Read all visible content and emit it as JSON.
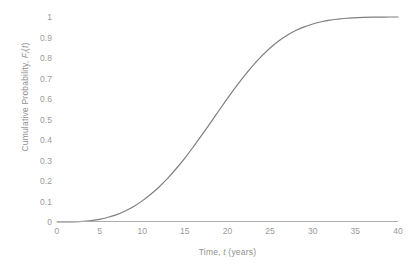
{
  "chart_data": {
    "type": "line",
    "title": "",
    "xlabel": "Time, t (years)",
    "ylabel": "Cumulative Probability, Fi(t)",
    "xlabel_parts": {
      "prefix": "Time, ",
      "symbol": "t",
      "suffix": " (years)"
    },
    "ylabel_parts": {
      "prefix": "Cumulative Probability, ",
      "symbol": "F",
      "subscript": "i",
      "suffix": "(t)"
    },
    "xlim": [
      0,
      40
    ],
    "ylim": [
      0,
      1
    ],
    "xticks": [
      0,
      5,
      10,
      15,
      20,
      25,
      30,
      35,
      40
    ],
    "xtick_labels": [
      "0",
      "5",
      "10",
      "15",
      "20",
      "25",
      "30",
      "35",
      "40"
    ],
    "yticks": [
      0,
      0.1,
      0.2,
      0.3,
      0.4,
      0.5,
      0.6,
      0.7,
      0.8,
      0.9,
      1
    ],
    "ytick_labels": [
      "0",
      "0.1",
      "0.2",
      "0.3",
      "0.4",
      "0.5",
      "0.6",
      "0.7",
      "0.8",
      "0.9",
      "1"
    ],
    "grid": false,
    "legend": null,
    "legend_position": "none",
    "line_color": "#7f7f7f",
    "line_width": 1.2,
    "series": [
      {
        "name": "Cumulative Probability",
        "x": [
          0,
          1,
          2,
          3,
          4,
          5,
          6,
          7,
          8,
          9,
          10,
          11,
          12,
          13,
          14,
          15,
          16,
          17,
          18,
          19,
          20,
          21,
          22,
          23,
          24,
          25,
          26,
          27,
          28,
          29,
          30,
          31,
          32,
          33,
          34,
          35,
          36,
          37,
          38,
          39,
          40
        ],
        "values": [
          0.0,
          0.0,
          0.001,
          0.003,
          0.007,
          0.013,
          0.023,
          0.036,
          0.054,
          0.076,
          0.103,
          0.135,
          0.172,
          0.214,
          0.261,
          0.312,
          0.367,
          0.425,
          0.484,
          0.544,
          0.603,
          0.66,
          0.714,
          0.764,
          0.809,
          0.849,
          0.883,
          0.911,
          0.934,
          0.952,
          0.966,
          0.977,
          0.985,
          0.99,
          0.994,
          0.996,
          0.998,
          0.999,
          0.999,
          1.0,
          1.0
        ]
      }
    ]
  }
}
